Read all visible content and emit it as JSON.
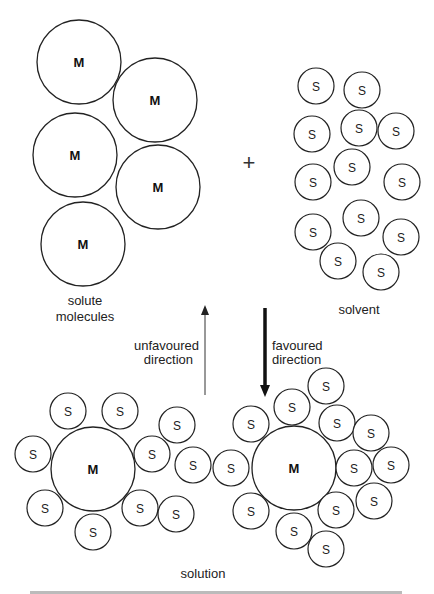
{
  "labels": {
    "solute_line1": "solute",
    "solute_line2": "molecules",
    "solvent": "solvent",
    "plus": "+",
    "unfavoured_line1": "unfavoured",
    "unfavoured_line2": "direction",
    "favoured_line1": "favoured",
    "favoured_line2": "direction",
    "solution": "solution",
    "solute_symbol": "M",
    "solvent_symbol": "S"
  },
  "diagram": {
    "solute_molecules": [
      [
        79,
        62
      ],
      [
        155,
        100
      ],
      [
        75,
        155
      ],
      [
        158,
        187
      ],
      [
        83,
        244
      ]
    ],
    "solvent_molecules": [
      [
        316,
        86
      ],
      [
        362,
        90
      ],
      [
        312,
        134
      ],
      [
        359,
        128
      ],
      [
        396,
        131
      ],
      [
        313,
        182
      ],
      [
        352,
        167
      ],
      [
        402,
        182
      ],
      [
        313,
        232
      ],
      [
        361,
        218
      ],
      [
        401,
        237
      ],
      [
        338,
        261
      ],
      [
        381,
        272
      ]
    ],
    "solvated_left": {
      "center": [
        93,
        469
      ],
      "solvent": [
        [
          68,
          411
        ],
        [
          120,
          411
        ],
        [
          33,
          454
        ],
        [
          152,
          454
        ],
        [
          177,
          425
        ],
        [
          193,
          465
        ],
        [
          45,
          508
        ],
        [
          140,
          508
        ],
        [
          93,
          532
        ],
        [
          176,
          514
        ]
      ]
    },
    "solvated_right": {
      "center": [
        294,
        468
      ],
      "solvent": [
        [
          251,
          424
        ],
        [
          292,
          407
        ],
        [
          326,
          386
        ],
        [
          337,
          423
        ],
        [
          371,
          433
        ],
        [
          231,
          468
        ],
        [
          354,
          468
        ],
        [
          391,
          465
        ],
        [
          251,
          511
        ],
        [
          294,
          531
        ],
        [
          336,
          510
        ],
        [
          374,
          501
        ],
        [
          326,
          549
        ]
      ]
    },
    "arrows": [
      {
        "name": "unfavoured",
        "from": [
          205,
          395
        ],
        "to": [
          205,
          307
        ],
        "weight": "thin"
      },
      {
        "name": "favoured",
        "from": [
          265,
          308
        ],
        "to": [
          265,
          395
        ],
        "weight": "thick"
      }
    ]
  }
}
